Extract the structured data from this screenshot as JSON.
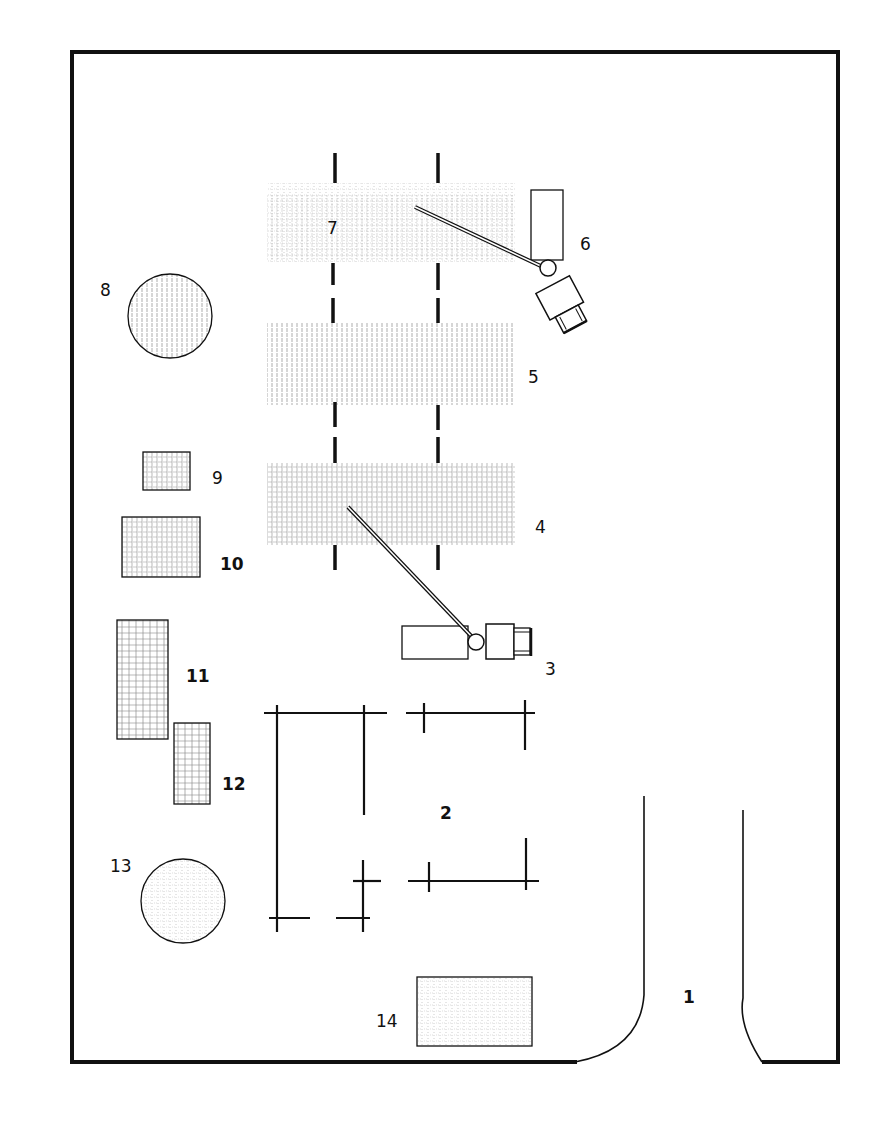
{
  "diagram": {
    "type": "site-plan",
    "colors": {
      "line": "#111111",
      "hatch": "#8a8a8a",
      "background": "#ffffff"
    },
    "labels": {
      "1": "1",
      "2": "2",
      "3": "3",
      "4": "4",
      "5": "5",
      "6": "6",
      "7": "7",
      "8": "8",
      "9": "9",
      "10": "10",
      "11": "11",
      "12": "12",
      "13": "13",
      "14": "14"
    },
    "elements": [
      {
        "id": "1",
        "kind": "entrance-road"
      },
      {
        "id": "2",
        "kind": "building-outline"
      },
      {
        "id": "3",
        "kind": "crane-horizontal"
      },
      {
        "id": "4",
        "kind": "storage-area-crosshatch"
      },
      {
        "id": "5",
        "kind": "storage-area-vertical-hatch"
      },
      {
        "id": "6",
        "kind": "crane-rotated"
      },
      {
        "id": "7",
        "kind": "storage-area-dotted"
      },
      {
        "id": "8",
        "kind": "circular-tank"
      },
      {
        "id": "9",
        "kind": "small-storage-block"
      },
      {
        "id": "10",
        "kind": "storage-block"
      },
      {
        "id": "11",
        "kind": "tall-storage-block"
      },
      {
        "id": "12",
        "kind": "storage-block"
      },
      {
        "id": "13",
        "kind": "circular-tank"
      },
      {
        "id": "14",
        "kind": "storage-block-dotted"
      }
    ]
  }
}
